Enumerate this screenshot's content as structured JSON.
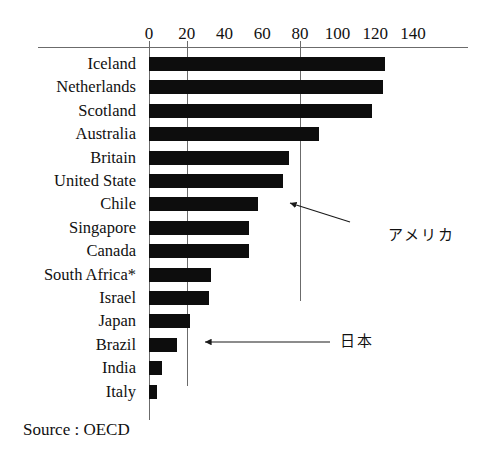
{
  "chart_data": {
    "type": "bar",
    "orientation": "horizontal",
    "title": "",
    "xlabel": "",
    "ylabel": "",
    "xlim": [
      0,
      145
    ],
    "grid": true,
    "gridlines_at": [
      0,
      20,
      80
    ],
    "x_ticks": [
      0,
      20,
      40,
      60,
      80,
      100,
      120,
      140
    ],
    "x_tick_labels": [
      "0",
      "20",
      "40",
      "60",
      "80",
      "100",
      "120",
      "140"
    ],
    "categories": [
      "Iceland",
      "Netherlands",
      "Scotland",
      "Australia",
      "Britain",
      "United State",
      "Chile",
      "Singapore",
      "Canada",
      "South Africa*",
      "Israel",
      "Japan",
      "Brazil",
      "India",
      "Italy"
    ],
    "values": [
      125,
      124,
      118,
      90,
      74,
      71,
      58,
      53,
      53,
      33,
      32,
      22,
      15,
      7,
      4
    ],
    "legend": [],
    "annotations": [
      {
        "text": "アメリカ",
        "target_category": "United State"
      },
      {
        "text": "日本",
        "target_category": "Japan"
      }
    ],
    "source": "Source : OECD",
    "bar_color": "#0d0d0d",
    "axis_color": "#6b6b6b"
  },
  "footnote": {
    "source_label": "Source : OECD"
  },
  "annotation_labels": {
    "america": "アメリカ",
    "japan": "日本"
  }
}
